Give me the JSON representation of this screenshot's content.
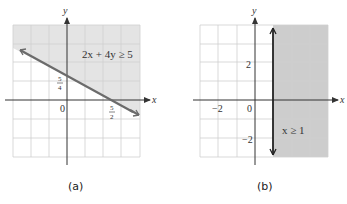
{
  "panels": [
    {
      "caption": "(a)",
      "inequality": "2x + 4y ≥ 5",
      "axis_x_label": "x",
      "axis_y_label": "y",
      "origin_label": "0",
      "y_intercept_label": {
        "num": "5",
        "den": "4"
      },
      "x_intercept_label": {
        "num": "5",
        "den": "2"
      },
      "shaded_region": "above line 2x + 4y = 5",
      "boundary": "solid line"
    },
    {
      "caption": "(b)",
      "inequality": "x ≥ 1",
      "axis_x_label": "x",
      "axis_y_label": "y",
      "origin_label": "0",
      "tick_labels": {
        "x_neg2": "−2",
        "y_pos2": "2",
        "y_neg2": "−2"
      },
      "shaded_region": "right of x = 1",
      "boundary": "solid vertical line"
    }
  ],
  "colors": {
    "shade": "#e4e4e4",
    "shade_dark": "#c9c9c9",
    "grid": "#c8c8c8",
    "axis": "#333333",
    "boundary_a": "#6b6b6b",
    "boundary_b": "#222222"
  }
}
